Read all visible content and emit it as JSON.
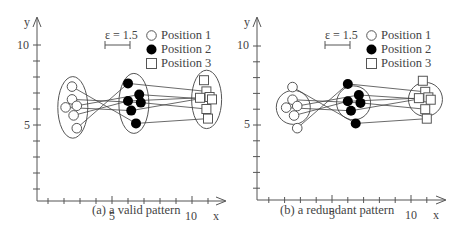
{
  "chart_data": [
    {
      "type": "scatter",
      "title": "(a) a valid pattern",
      "xlabel": "x",
      "ylabel": "y",
      "x_ticks": [
        5,
        10
      ],
      "y_ticks": [
        5,
        10
      ],
      "xlim": [
        0,
        12
      ],
      "ylim": [
        0,
        11
      ],
      "epsilon_label": "ε = 1.5",
      "legend": [
        "Position 1",
        "Position 2",
        "Position 3"
      ],
      "grouping": "ellipses",
      "series": [
        {
          "name": "Position 1",
          "marker": "open-circle",
          "points": [
            [
              2.5,
              7.4
            ],
            [
              2.5,
              6.6
            ],
            [
              2.1,
              6.1
            ],
            [
              2.8,
              6.2
            ],
            [
              2.6,
              5.6
            ],
            [
              2.8,
              4.8
            ]
          ]
        },
        {
          "name": "Position 2",
          "marker": "filled-circle",
          "points": [
            [
              6.0,
              7.6
            ],
            [
              6.7,
              6.9
            ],
            [
              6.0,
              6.5
            ],
            [
              6.8,
              6.4
            ],
            [
              6.2,
              5.9
            ],
            [
              6.5,
              5.1
            ]
          ]
        },
        {
          "name": "Position 3",
          "marker": "open-square",
          "points": [
            [
              10.75,
              7.8
            ],
            [
              10.9,
              7.1
            ],
            [
              10.5,
              6.7
            ],
            [
              11.1,
              6.75
            ],
            [
              11.25,
              6.6
            ],
            [
              10.9,
              6.0
            ],
            [
              11.0,
              5.4
            ]
          ]
        }
      ]
    },
    {
      "type": "scatter",
      "title": "(b) a redundant pattern",
      "xlabel": "x",
      "ylabel": "y",
      "x_ticks": [
        5,
        10
      ],
      "y_ticks": [
        5,
        10
      ],
      "xlim": [
        0,
        12
      ],
      "ylim": [
        0,
        11
      ],
      "epsilon_label": "ε = 1.5",
      "legend": [
        "Position 1",
        "Position 2",
        "Position 3"
      ],
      "grouping": "circles",
      "series": [
        {
          "name": "Position 1",
          "marker": "open-circle",
          "points": [
            [
              2.5,
              7.4
            ],
            [
              2.5,
              6.6
            ],
            [
              2.1,
              6.1
            ],
            [
              2.8,
              6.2
            ],
            [
              2.6,
              5.6
            ],
            [
              2.8,
              4.8
            ]
          ]
        },
        {
          "name": "Position 2",
          "marker": "filled-circle",
          "points": [
            [
              6.0,
              7.6
            ],
            [
              6.7,
              6.9
            ],
            [
              6.0,
              6.5
            ],
            [
              6.8,
              6.4
            ],
            [
              6.2,
              5.9
            ],
            [
              6.5,
              5.1
            ]
          ]
        },
        {
          "name": "Position 3",
          "marker": "open-square",
          "points": [
            [
              10.75,
              7.8
            ],
            [
              10.9,
              7.1
            ],
            [
              10.5,
              6.7
            ],
            [
              11.1,
              6.75
            ],
            [
              11.25,
              6.6
            ],
            [
              10.9,
              6.0
            ],
            [
              11.0,
              5.4
            ]
          ]
        }
      ]
    }
  ],
  "panels": {
    "a": {
      "caption": "(a) a valid pattern",
      "epsilon": "ε = 1.5",
      "legend": {
        "p1": "Position 1",
        "p2": "Position 2",
        "p3": "Position 3"
      },
      "axis": {
        "x": "x",
        "y": "y",
        "x5": "5",
        "x10": "10",
        "y5": "5",
        "y10": "10"
      }
    },
    "b": {
      "caption": "(b) a redundant pattern",
      "epsilon": "ε = 1.5",
      "legend": {
        "p1": "Position 1",
        "p2": "Position 2",
        "p3": "Position 3"
      },
      "axis": {
        "x": "x",
        "y": "y",
        "x5": "5",
        "x10": "10",
        "y5": "5",
        "y10": "10"
      }
    }
  },
  "colors": {
    "ink": "#444444",
    "fill": "#000000",
    "background": "#ffffff"
  }
}
